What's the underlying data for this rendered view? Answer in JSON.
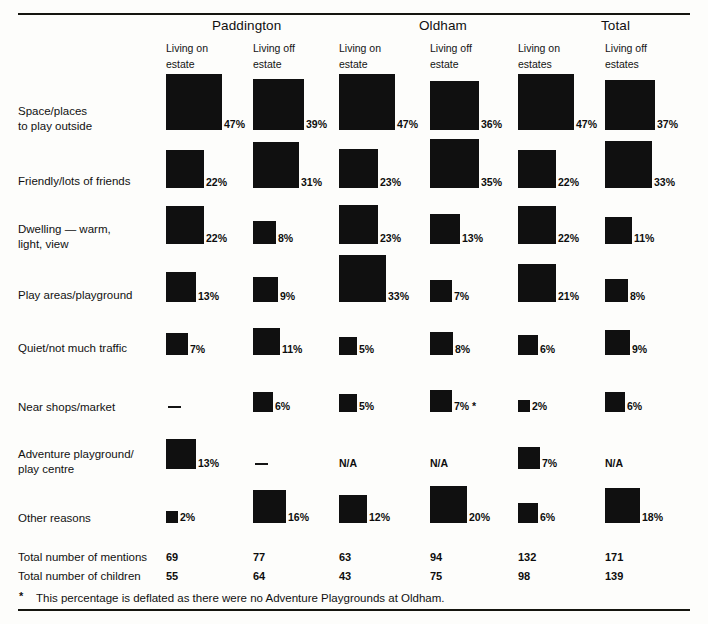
{
  "figure": {
    "groups": [
      {
        "label": "Paddington",
        "x": 212
      },
      {
        "label": "Oldham",
        "x": 419
      },
      {
        "label": "Total",
        "x": 601
      }
    ],
    "columns": [
      {
        "key": "pad_on",
        "line1": "Living on",
        "line2": "estate",
        "x": 166
      },
      {
        "key": "pad_off",
        "line1": "Living off",
        "line2": "estate",
        "x": 253
      },
      {
        "key": "old_on",
        "line1": "Living on",
        "line2": "estate",
        "x": 339
      },
      {
        "key": "old_off",
        "line1": "Living off",
        "line2": "estate",
        "x": 430
      },
      {
        "key": "tot_on",
        "line1": "Living on",
        "line2": "estates",
        "x": 518
      },
      {
        "key": "tot_off",
        "line1": "Living off",
        "line2": "estates",
        "x": 605
      }
    ],
    "rows": [
      {
        "label_lines": [
          "Space/places",
          "to play outside"
        ],
        "label_top": 104,
        "baseline": 130,
        "cells": [
          {
            "kind": "value",
            "value": 47,
            "text": "47%"
          },
          {
            "kind": "value",
            "value": 39,
            "text": "39%"
          },
          {
            "kind": "value",
            "value": 47,
            "text": "47%"
          },
          {
            "kind": "value",
            "value": 36,
            "text": "36%"
          },
          {
            "kind": "value",
            "value": 47,
            "text": "47%"
          },
          {
            "kind": "value",
            "value": 37,
            "text": "37%"
          }
        ]
      },
      {
        "label_lines": [
          "Friendly/lots of friends"
        ],
        "label_top": 174,
        "baseline": 188,
        "cells": [
          {
            "kind": "value",
            "value": 22,
            "text": "22%"
          },
          {
            "kind": "value",
            "value": 31,
            "text": "31%"
          },
          {
            "kind": "value",
            "value": 23,
            "text": "23%"
          },
          {
            "kind": "value",
            "value": 35,
            "text": "35%"
          },
          {
            "kind": "value",
            "value": 22,
            "text": "22%"
          },
          {
            "kind": "value",
            "value": 33,
            "text": "33%"
          }
        ]
      },
      {
        "label_lines": [
          "Dwelling — warm,",
          "light, view"
        ],
        "label_top": 222,
        "baseline": 244,
        "cells": [
          {
            "kind": "value",
            "value": 22,
            "text": "22%"
          },
          {
            "kind": "value",
            "value": 8,
            "text": "8%"
          },
          {
            "kind": "value",
            "value": 23,
            "text": "23%"
          },
          {
            "kind": "value",
            "value": 13,
            "text": "13%"
          },
          {
            "kind": "value",
            "value": 22,
            "text": "22%"
          },
          {
            "kind": "value",
            "value": 11,
            "text": "11%"
          }
        ]
      },
      {
        "label_lines": [
          "Play areas/playground"
        ],
        "label_top": 288,
        "baseline": 302,
        "cells": [
          {
            "kind": "value",
            "value": 13,
            "text": "13%"
          },
          {
            "kind": "value",
            "value": 9,
            "text": "9%"
          },
          {
            "kind": "value",
            "value": 33,
            "text": "33%"
          },
          {
            "kind": "value",
            "value": 7,
            "text": "7%"
          },
          {
            "kind": "value",
            "value": 21,
            "text": "21%"
          },
          {
            "kind": "value",
            "value": 8,
            "text": "8%"
          }
        ]
      },
      {
        "label_lines": [
          "Quiet/not much traffic"
        ],
        "label_top": 341,
        "baseline": 355,
        "cells": [
          {
            "kind": "value",
            "value": 7,
            "text": "7%"
          },
          {
            "kind": "value",
            "value": 11,
            "text": "11%"
          },
          {
            "kind": "value",
            "value": 5,
            "text": "5%"
          },
          {
            "kind": "value",
            "value": 8,
            "text": "8%"
          },
          {
            "kind": "value",
            "value": 6,
            "text": "6%"
          },
          {
            "kind": "value",
            "value": 9,
            "text": "9%"
          }
        ]
      },
      {
        "label_lines": [
          "Near shops/market"
        ],
        "label_top": 400,
        "baseline": 412,
        "cells": [
          {
            "kind": "dash"
          },
          {
            "kind": "value",
            "value": 6,
            "text": "6%"
          },
          {
            "kind": "value",
            "value": 5,
            "text": "5%"
          },
          {
            "kind": "value",
            "value": 7,
            "text": "7% *"
          },
          {
            "kind": "value",
            "value": 2,
            "text": "2%"
          },
          {
            "kind": "value",
            "value": 6,
            "text": "6%"
          }
        ]
      },
      {
        "label_lines": [
          "Adventure playground/",
          "play centre"
        ],
        "label_top": 447,
        "baseline": 469,
        "cells": [
          {
            "kind": "value",
            "value": 13,
            "text": "13%"
          },
          {
            "kind": "dash"
          },
          {
            "kind": "na",
            "text": "N/A"
          },
          {
            "kind": "na",
            "text": "N/A"
          },
          {
            "kind": "value",
            "value": 7,
            "text": "7%"
          },
          {
            "kind": "na",
            "text": "N/A"
          }
        ]
      },
      {
        "label_lines": [
          "Other reasons"
        ],
        "label_top": 511,
        "baseline": 523,
        "cells": [
          {
            "kind": "value",
            "value": 2,
            "text": "2%"
          },
          {
            "kind": "value",
            "value": 16,
            "text": "16%"
          },
          {
            "kind": "value",
            "value": 12,
            "text": "12%"
          },
          {
            "kind": "value",
            "value": 20,
            "text": "20%"
          },
          {
            "kind": "value",
            "value": 6,
            "text": "6%"
          },
          {
            "kind": "value",
            "value": 18,
            "text": "18%"
          }
        ]
      }
    ],
    "totals": [
      {
        "label": "Total number of mentions",
        "top": 550,
        "values": [
          "69",
          "77",
          "63",
          "94",
          "132",
          "171"
        ]
      },
      {
        "label": "Total number of children",
        "top": 569,
        "values": [
          "55",
          "64",
          "43",
          "75",
          "98",
          "139"
        ]
      }
    ],
    "footnote": {
      "marker": "*",
      "text": "This percentage is deflated as there were no Adventure Playgrounds at Oldham."
    }
  },
  "chart_data": {
    "type": "bar",
    "title": "",
    "subtitle": "",
    "xlabel": "",
    "ylabel": "",
    "note": "Area-coded squares: square side is proportional to the square root of the percentage value. Bottom-aligned on a common baseline per row.",
    "grid": false,
    "legend_position": "none",
    "groups": [
      "Paddington",
      "Oldham",
      "Total"
    ],
    "categories": [
      "Space/places to play outside",
      "Friendly/lots of friends",
      "Dwelling — warm, light, view",
      "Play areas/playground",
      "Quiet/not much traffic",
      "Near shops/market",
      "Adventure playground/play centre",
      "Other reasons"
    ],
    "series": [
      {
        "name": "Paddington — Living on estate",
        "values": [
          47,
          22,
          22,
          13,
          7,
          null,
          13,
          2
        ]
      },
      {
        "name": "Paddington — Living off estate",
        "values": [
          39,
          31,
          8,
          9,
          11,
          6,
          null,
          16
        ]
      },
      {
        "name": "Oldham — Living on estate",
        "values": [
          47,
          23,
          23,
          33,
          5,
          5,
          null,
          12
        ]
      },
      {
        "name": "Oldham — Living off estate",
        "values": [
          36,
          35,
          13,
          7,
          8,
          7,
          null,
          20
        ]
      },
      {
        "name": "Total — Living on estates",
        "values": [
          47,
          22,
          22,
          21,
          6,
          2,
          7,
          6
        ]
      },
      {
        "name": "Total — Living off estates",
        "values": [
          37,
          33,
          11,
          8,
          9,
          6,
          null,
          18
        ]
      }
    ],
    "series_missing_marker": [
      {
        "name": "Paddington — Living on estate",
        "markers": [
          null,
          null,
          null,
          null,
          null,
          "—",
          null,
          null
        ]
      },
      {
        "name": "Paddington — Living off estate",
        "markers": [
          null,
          null,
          null,
          null,
          null,
          null,
          "—",
          null
        ]
      },
      {
        "name": "Oldham — Living on estate",
        "markers": [
          null,
          null,
          null,
          null,
          null,
          null,
          "N/A",
          null
        ]
      },
      {
        "name": "Oldham — Living off estate",
        "markers": [
          null,
          null,
          null,
          null,
          null,
          null,
          "N/A",
          null
        ]
      },
      {
        "name": "Total — Living off estates",
        "markers": [
          null,
          null,
          null,
          null,
          null,
          null,
          "N/A",
          null
        ]
      }
    ],
    "annotations": [
      "7% * (Oldham — Living off estate, Near shops/market)"
    ],
    "totals_mentions": {
      "Paddington — Living on estate": 69,
      "Paddington — Living off estate": 77,
      "Oldham — Living on estate": 63,
      "Oldham — Living off estate": 94,
      "Total — Living on estates": 132,
      "Total — Living off estates": 171
    },
    "totals_children": {
      "Paddington — Living on estate": 55,
      "Paddington — Living off estate": 64,
      "Oldham — Living on estate": 43,
      "Oldham — Living off estate": 75,
      "Total — Living on estates": 98,
      "Total — Living off estates": 139
    }
  },
  "colors": {
    "ink": "#101010",
    "paper": "#fdfdfb",
    "rule": "#15150f"
  }
}
